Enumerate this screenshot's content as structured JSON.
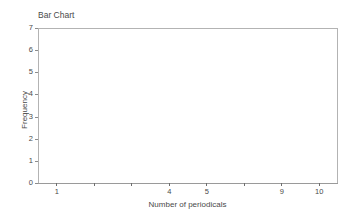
{
  "chart_data": {
    "type": "bar",
    "title": "Bar Chart",
    "xlabel": "Number of periodicals",
    "ylabel": "Frequency",
    "categories": [
      "1",
      "",
      "",
      "4",
      "5",
      "",
      "9",
      "10"
    ],
    "values": [
      0,
      0,
      0,
      0,
      0,
      0,
      0,
      0
    ],
    "x_tick_labels": [
      "1",
      "",
      "",
      "4",
      "5",
      "",
      "9",
      "10"
    ],
    "y_tick_labels": [
      "0",
      "1",
      "2",
      "3",
      "4",
      "5",
      "6",
      "7"
    ],
    "y_ticks": [
      0,
      1,
      2,
      3,
      4,
      5,
      6,
      7
    ],
    "ylim": [
      0,
      7
    ],
    "grid": false,
    "legend": false,
    "bars_rendered": 0,
    "colors": {
      "background": "#ffffff",
      "axis": "#b3b3b3",
      "axis_bottom": "#9a9a9a",
      "tick": "#6e6e6e",
      "text": "#4a4a4a",
      "bar": "#7f7f7f"
    }
  }
}
